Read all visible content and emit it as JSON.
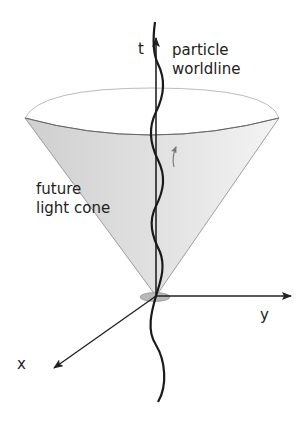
{
  "labels": {
    "t_axis": "t",
    "y_axis": "y",
    "x_axis": "x",
    "worldline_line1": "particle",
    "worldline_line2": "worldline",
    "cone_line1": "future",
    "cone_line2": "light cone"
  },
  "colors": {
    "cone_fill": "#dcdcdc",
    "cone_fill_light": "#f0f0f0",
    "axis": "#222222",
    "worldline": "#1a1a1a",
    "rim": "#9a9a9a",
    "origin_disc": "#b8b8b8"
  }
}
